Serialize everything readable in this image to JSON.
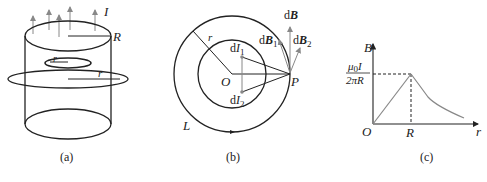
{
  "figure_a": {
    "caption": "(a)",
    "labels": {
      "current": "I",
      "radius_big": "R",
      "radius_inner": "r",
      "radius_outer": "r"
    }
  },
  "figure_b": {
    "caption": "(b)",
    "labels": {
      "origin": "O",
      "point": "P",
      "radius": "r",
      "loop": "L",
      "dI1_prefix": "d",
      "dI1_main": "I",
      "dI1_sub": "1",
      "dI2_prefix": "d",
      "dI2_main": "I",
      "dI2_sub": "2",
      "dB_prefix": "d",
      "dB_main": "B",
      "dB1_prefix": "d",
      "dB1_main": "B",
      "dB1_sub": "1",
      "dB2_prefix": "d",
      "dB2_main": "B",
      "dB2_sub": "2"
    }
  },
  "figure_c": {
    "caption": "(c)",
    "y_axis_label": "B",
    "x_axis_label": "r",
    "origin_label": "O",
    "x_tick_label": "R",
    "y_tick_numerator_mu": "μ",
    "y_tick_numerator_sub": "0",
    "y_tick_numerator_I": "I",
    "y_tick_denominator": "2πR"
  },
  "colors": {
    "line": "#222222",
    "vector": "#888888"
  }
}
